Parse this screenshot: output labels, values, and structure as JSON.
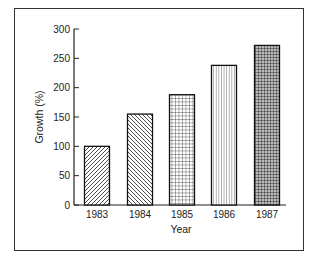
{
  "chart_data": {
    "type": "bar",
    "title": "",
    "xlabel": "Year",
    "ylabel": "Growth (%)",
    "categories": [
      "1983",
      "1984",
      "1985",
      "1986",
      "1987"
    ],
    "values": [
      100,
      155,
      188,
      238,
      272
    ],
    "ylim": [
      0,
      300
    ],
    "yticks": [
      0,
      50,
      100,
      150,
      200,
      250,
      300
    ],
    "grid": false,
    "legend": null,
    "bar_patterns": [
      "diagonal-forward",
      "diagonal-back",
      "grid-fine",
      "vertical-lines",
      "grid-dense"
    ],
    "colors": {
      "ink": "#222222",
      "background": "#ffffff"
    }
  }
}
